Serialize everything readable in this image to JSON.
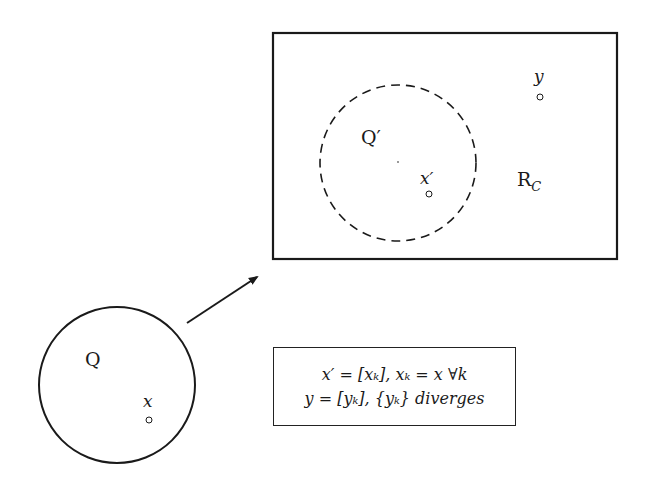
{
  "diagram": {
    "source_region": {
      "label": "Q",
      "point": {
        "label": "x"
      }
    },
    "target_region": {
      "label": "R",
      "label_sub": "C",
      "inner_region": {
        "label": "Q′",
        "point": {
          "label": "x′"
        }
      },
      "outer_point": {
        "label": "y"
      }
    },
    "arrow": {
      "from": "source_region",
      "to": "target_region"
    },
    "formula_box": {
      "line1": "x′ = [xₖ],  xₖ = x ∀k",
      "line2": "y = [yₖ], {yₖ} diverges"
    }
  },
  "colors": {
    "stroke": "#1a1a1a",
    "background": "#ffffff"
  }
}
